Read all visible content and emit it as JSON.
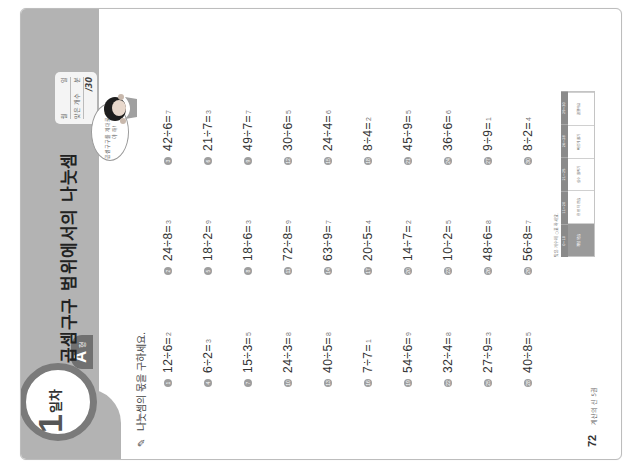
{
  "header": {
    "day_number": "1",
    "day_label": "일차",
    "type_letter": "A",
    "type_suffix": "형",
    "title": "곱셈구구 범위에서의 나눗셈",
    "score_box": {
      "month_label": "월",
      "day_label": "일",
      "correct_label": "맞은 개수",
      "min_label": "분",
      "total": "/30"
    },
    "speech_bubble": "곱셈구구를 제대로 알아야 해!"
  },
  "instruction": "나눗셈의 몫을 구하세요.",
  "problems": [
    {
      "num": "1",
      "expr": "12÷6=",
      "answer": "2"
    },
    {
      "num": "2",
      "expr": "24÷8=",
      "answer": "3"
    },
    {
      "num": "3",
      "expr": "42÷6=",
      "answer": "7"
    },
    {
      "num": "4",
      "expr": "6÷2=",
      "answer": "3"
    },
    {
      "num": "5",
      "expr": "18÷2=",
      "answer": "9"
    },
    {
      "num": "6",
      "expr": "21÷7=",
      "answer": "3"
    },
    {
      "num": "7",
      "expr": "15÷3=",
      "answer": "5"
    },
    {
      "num": "8",
      "expr": "18÷6=",
      "answer": "3"
    },
    {
      "num": "9",
      "expr": "49÷7=",
      "answer": "7"
    },
    {
      "num": "10",
      "expr": "24÷3=",
      "answer": "8"
    },
    {
      "num": "11",
      "expr": "72÷8=",
      "answer": "9"
    },
    {
      "num": "12",
      "expr": "30÷6=",
      "answer": "5"
    },
    {
      "num": "13",
      "expr": "40÷5=",
      "answer": "8"
    },
    {
      "num": "14",
      "expr": "63÷9=",
      "answer": "7"
    },
    {
      "num": "15",
      "expr": "24÷4=",
      "answer": "6"
    },
    {
      "num": "16",
      "expr": "7÷7=",
      "answer": "1"
    },
    {
      "num": "17",
      "expr": "20÷5=",
      "answer": "4"
    },
    {
      "num": "18",
      "expr": "8÷4=",
      "answer": "2"
    },
    {
      "num": "19",
      "expr": "54÷6=",
      "answer": "9"
    },
    {
      "num": "20",
      "expr": "14÷7=",
      "answer": "2"
    },
    {
      "num": "21",
      "expr": "45÷9=",
      "answer": "5"
    },
    {
      "num": "22",
      "expr": "32÷4=",
      "answer": "8"
    },
    {
      "num": "23",
      "expr": "10÷2=",
      "answer": "5"
    },
    {
      "num": "24",
      "expr": "36÷6=",
      "answer": "6"
    },
    {
      "num": "25",
      "expr": "27÷9=",
      "answer": "3"
    },
    {
      "num": "26",
      "expr": "48÷6=",
      "answer": "8"
    },
    {
      "num": "27",
      "expr": "9÷9=",
      "answer": "1"
    },
    {
      "num": "28",
      "expr": "40÷8=",
      "answer": "5"
    },
    {
      "num": "29",
      "expr": "56÷8=",
      "answer": "7"
    },
    {
      "num": "30",
      "expr": "8÷2=",
      "answer": "4"
    }
  ],
  "legend": {
    "note": "맞은 개수에 ○표 하세요.",
    "headers": [
      "0~10",
      "11~20",
      "21~25",
      "26~28",
      "29~30"
    ],
    "cells": [
      "개념 복습",
      "한 번 더 연습",
      "실수 줄이기",
      "빠르게 풀기",
      "잘했어요"
    ]
  },
  "footer": {
    "page_number": "72",
    "book_title": "계산의 신 5권"
  },
  "colors": {
    "header_gray": "#b3b3b3",
    "badge_ring": "#7a7a7a",
    "tab_gray": "#707070"
  }
}
